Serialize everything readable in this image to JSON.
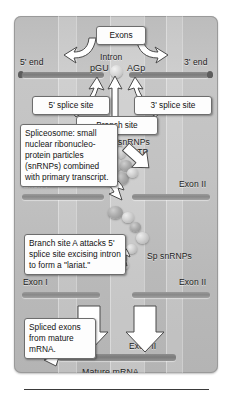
{
  "figure": {
    "panel_bg": "#c2c2c2",
    "ink": "#1e1e1e"
  },
  "stage1": {
    "five_prime_end": "5' end",
    "three_prime_end": "3' end",
    "exons_label": "Exons",
    "intron_label": "Intron",
    "five_splice_seq": "pGU",
    "three_splice_seq": "AGp",
    "five_splice_site": "5' splice site",
    "three_splice_site": "3' splice site",
    "branch_site": "Branch site"
  },
  "stage2": {
    "spliceosome_note": "Spliceosome: small nuclear ribonucleo-protein particles (snRNPs) combined with primary transcript.",
    "snrnps_label": "Sp snRNPs",
    "atp_label": "ATP",
    "exon_left": "Exon I",
    "exon_right": "Exon II"
  },
  "stage3": {
    "lariat_note": "Branch site A attacks 5' splice site excising intron to form a \"lariat.\"",
    "snrnps_label": "Sp snRNPs",
    "exon_left": "Exon I",
    "exon_right": "Exon II"
  },
  "stage4": {
    "spliced_note": "Spliced exons from mature mRNA.",
    "exon_left": "Exon I",
    "exon_right": "Exon II",
    "mature_mrna": "Mature mRNA"
  }
}
